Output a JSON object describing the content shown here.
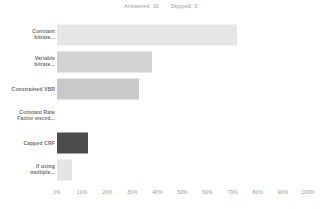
{
  "header": {
    "answered_label": "Answered:",
    "answered_value": "16",
    "skipped_label": "Skipped:",
    "skipped_value": "0"
  },
  "chart_data": {
    "type": "bar",
    "orientation": "horizontal",
    "title": "",
    "xlabel": "",
    "ylabel": "",
    "xlim": [
      0,
      100
    ],
    "grid": false,
    "legend": "none",
    "tick_labels": [
      "0%",
      "10%",
      "20%",
      "30%",
      "40%",
      "50%",
      "60%",
      "70%",
      "80%",
      "90%",
      "100%"
    ],
    "ticks": [
      0,
      10,
      20,
      30,
      40,
      50,
      60,
      70,
      80,
      90,
      100
    ],
    "categories": [
      "Constant\nbitrate...",
      "Variable\nbitrate...",
      "Constrained VBR",
      "Constant Rate\nFactor encod...",
      "Capped CRF",
      "If using\nmultiple..."
    ],
    "values": [
      71.8,
      37.8,
      32.6,
      0,
      12.5,
      6.0
    ],
    "colors": [
      "#e6e6e6",
      "#d2d2d2",
      "#c9c9c9",
      "#e0e0e0",
      "#4c4c4c",
      "#e4e4e4"
    ]
  }
}
